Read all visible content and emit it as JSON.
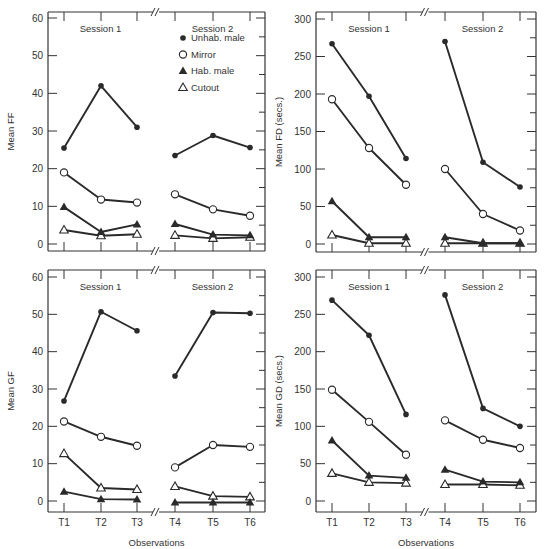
{
  "figure": {
    "xlabel": "Observations",
    "session_labels": [
      "Session 1",
      "Session 2"
    ],
    "x_ticks": [
      "T1",
      "T2",
      "T3",
      "T4",
      "T5",
      "T6"
    ]
  },
  "legend": [
    {
      "name": "Unhab. male",
      "marker": "filled-circle"
    },
    {
      "name": "Mirror",
      "marker": "open-circle"
    },
    {
      "name": "Hab. male",
      "marker": "filled-triangle"
    },
    {
      "name": "Cutout",
      "marker": "open-triangle"
    }
  ],
  "colors": {
    "line": "#2a2a2a",
    "frame": "#333333",
    "background": "#ffffff"
  },
  "chart_data": [
    {
      "type": "line",
      "title": "",
      "ylabel": "Mean FF",
      "xlabel": "",
      "categories": [
        "T1",
        "T2",
        "T3",
        "T4",
        "T5",
        "T6"
      ],
      "ylim": [
        0,
        60
      ],
      "yticks": [
        0,
        10,
        20,
        30,
        40,
        50,
        60
      ],
      "show_legend": true,
      "show_xticklabels": false,
      "series": [
        {
          "name": "Unhab. male",
          "values": [
            25.5,
            42,
            31,
            23.5,
            28.8,
            25.6
          ]
        },
        {
          "name": "Mirror",
          "values": [
            19,
            11.8,
            11,
            13.2,
            9.2,
            7.5
          ]
        },
        {
          "name": "Hab. male",
          "values": [
            9.8,
            3.2,
            5.2,
            5.3,
            2.5,
            2.3
          ]
        },
        {
          "name": "Cutout",
          "values": [
            3.7,
            2.2,
            2.6,
            2.3,
            1.5,
            1.8
          ]
        }
      ]
    },
    {
      "type": "line",
      "title": "",
      "ylabel": "Mean FD (secs.)",
      "xlabel": "",
      "categories": [
        "T1",
        "T2",
        "T3",
        "T4",
        "T5",
        "T6"
      ],
      "ylim": [
        0,
        300
      ],
      "yticks": [
        0,
        50,
        100,
        150,
        200,
        250,
        300
      ],
      "show_legend": false,
      "show_xticklabels": false,
      "series": [
        {
          "name": "Unhab. male",
          "values": [
            267,
            197,
            114,
            270,
            109,
            76
          ]
        },
        {
          "name": "Mirror",
          "values": [
            193,
            128,
            79,
            100,
            40,
            18
          ]
        },
        {
          "name": "Hab. male",
          "values": [
            57,
            9,
            9,
            9,
            1,
            1
          ]
        },
        {
          "name": "Cutout",
          "values": [
            12,
            1,
            1,
            1,
            1,
            1
          ]
        }
      ]
    },
    {
      "type": "line",
      "title": "",
      "ylabel": "Mean GF",
      "xlabel": "Observations",
      "categories": [
        "T1",
        "T2",
        "T3",
        "T4",
        "T5",
        "T6"
      ],
      "ylim": [
        -2.8,
        60
      ],
      "yticks": [
        0,
        10,
        20,
        30,
        40,
        50,
        60
      ],
      "show_legend": false,
      "show_xticklabels": true,
      "series": [
        {
          "name": "Unhab. male",
          "values": [
            26.8,
            50.7,
            45.6,
            33.5,
            50.5,
            50.3
          ]
        },
        {
          "name": "Mirror",
          "values": [
            21.3,
            17.2,
            14.8,
            9,
            15,
            14.5
          ]
        },
        {
          "name": "Hab. male",
          "values": [
            2.5,
            0.5,
            0.4,
            -0.4,
            -0.4,
            -0.4
          ]
        },
        {
          "name": "Cutout",
          "values": [
            12.7,
            3.5,
            3.1,
            3.9,
            1.3,
            1.1
          ]
        }
      ]
    },
    {
      "type": "line",
      "title": "",
      "ylabel": "Mean GD (secs.)",
      "xlabel": "Observations",
      "categories": [
        "T1",
        "T2",
        "T3",
        "T4",
        "T5",
        "T6"
      ],
      "ylim": [
        -14,
        300
      ],
      "yticks": [
        0,
        50,
        100,
        150,
        200,
        250,
        300
      ],
      "show_legend": false,
      "show_xticklabels": true,
      "series": [
        {
          "name": "Unhab. male",
          "values": [
            269,
            222,
            116,
            276,
            124,
            100
          ]
        },
        {
          "name": "Mirror",
          "values": [
            149,
            106,
            62,
            108,
            82,
            71
          ]
        },
        {
          "name": "Hab. male",
          "values": [
            81,
            34,
            31,
            42,
            26,
            25
          ]
        },
        {
          "name": "Cutout",
          "values": [
            37,
            25,
            24,
            22,
            22,
            21
          ]
        }
      ]
    }
  ]
}
